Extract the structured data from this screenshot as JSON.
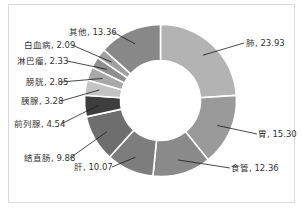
{
  "chart_data": {
    "type": "pie",
    "variant": "donut",
    "title": "",
    "categories": [
      "肺",
      "胃",
      "食管",
      "肝",
      "结直肠",
      "前列腺",
      "胰腺",
      "膀胱",
      "淋巴瘤",
      "白血病",
      "其他"
    ],
    "values": [
      23.93,
      15.3,
      12.36,
      10.07,
      9.88,
      4.54,
      3.28,
      2.85,
      2.33,
      2.09,
      13.36
    ],
    "labels": [
      "肺, 23.93",
      "胃, 15.30",
      "食管, 12.36",
      "肝, 10.07",
      "结直肠, 9.88",
      "前列腺, 4.54",
      "胰腺, 3.28",
      "膀胱, 2.85",
      "淋巴瘤, 2.33",
      "白血病, 2.09",
      "其他, 13.36"
    ],
    "colors": [
      "#b3b3b3",
      "#9a9a9a",
      "#8a8a8a",
      "#7d7d7d",
      "#6e6e6e",
      "#3e3e3e",
      "#c4c4c4",
      "#a8a8a8",
      "#8f8f8f",
      "#a0a0a0",
      "#888888"
    ],
    "start_angle_deg": 0,
    "direction": "clockwise",
    "legend": "none",
    "data_labels": "outside with leader lines"
  }
}
